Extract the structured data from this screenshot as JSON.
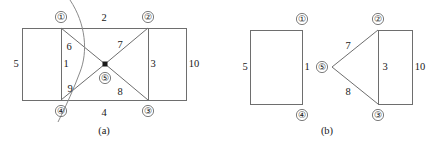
{
  "figure": {
    "panels": [
      {
        "id": "panel-a",
        "caption": "(a)",
        "nodes": [
          {
            "id": "n1",
            "label": "①",
            "x": 61,
            "y": 17
          },
          {
            "id": "n2",
            "label": "②",
            "x": 148,
            "y": 17
          },
          {
            "id": "n3",
            "label": "③",
            "x": 148,
            "y": 111
          },
          {
            "id": "n4",
            "label": "④",
            "x": 61,
            "y": 111
          },
          {
            "id": "n5",
            "label": "⑤",
            "x": 105,
            "y": 78
          }
        ],
        "edge_labels": [
          {
            "id": "e5",
            "text": "5",
            "x": 16,
            "y": 67
          },
          {
            "id": "e1",
            "text": "1",
            "x": 66,
            "y": 67
          },
          {
            "id": "e2",
            "text": "2",
            "x": 104,
            "y": 21
          },
          {
            "id": "e4",
            "text": "4",
            "x": 104,
            "y": 113
          },
          {
            "id": "e3",
            "text": "3",
            "x": 153,
            "y": 67
          },
          {
            "id": "e10",
            "text": "10",
            "x": 191,
            "y": 67
          },
          {
            "id": "e6",
            "text": "6",
            "x": 68,
            "y": 47
          },
          {
            "id": "e7",
            "text": "7",
            "x": 118,
            "y": 45
          },
          {
            "id": "e9",
            "text": "9",
            "x": 69,
            "y": 90
          },
          {
            "id": "e8",
            "text": "8",
            "x": 118,
            "y": 92
          }
        ]
      },
      {
        "id": "panel-b",
        "caption": "(b)",
        "nodes": [
          {
            "id": "n1",
            "label": "①",
            "x": 302,
            "y": 19
          },
          {
            "id": "n4",
            "label": "④",
            "x": 302,
            "y": 115
          },
          {
            "id": "n2",
            "label": "②",
            "x": 378,
            "y": 19
          },
          {
            "id": "n3",
            "label": "③",
            "x": 378,
            "y": 115
          },
          {
            "id": "n5",
            "label": "⑤",
            "x": 322,
            "y": 67
          }
        ],
        "edge_labels": [
          {
            "id": "e5",
            "text": "5",
            "x": 245,
            "y": 69
          },
          {
            "id": "e1",
            "text": "1",
            "x": 306,
            "y": 69
          },
          {
            "id": "e7",
            "text": "7",
            "x": 348,
            "y": 46
          },
          {
            "id": "e8",
            "text": "8",
            "x": 348,
            "y": 92
          },
          {
            "id": "e3",
            "text": "3",
            "x": 384,
            "y": 69
          },
          {
            "id": "e10",
            "text": "10",
            "x": 417,
            "y": 69
          }
        ]
      }
    ]
  }
}
